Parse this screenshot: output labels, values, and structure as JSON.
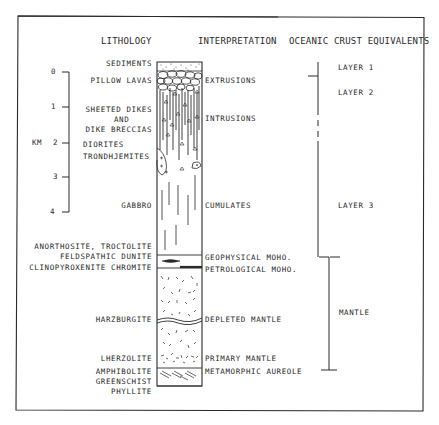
{
  "headers": {
    "lithology": "LITHOLOGY",
    "interpretation": "INTERPRETATION",
    "oceanic": "OCEANIC CRUST EQUIVALENTS"
  },
  "scale": {
    "unit": "KM",
    "ticks": [
      "0",
      "1",
      "2",
      "3",
      "4"
    ]
  },
  "lithology": [
    "SEDIMENTS",
    "PILLOW LAVAS",
    "SHEETED DIKES",
    "AND",
    "DIKE BRECCIAS",
    "DIORITES",
    "TRONDHJEMITES",
    "GABBRO",
    "ANORTHOSITE, TROCTOLITE",
    "FELDSPATHIC  DUNITE",
    "CLINOPYROXENITE  CHROMITE",
    "HARZBURGITE",
    "LHERZOLITE",
    "AMPHIBOLITE",
    "GREENSCHIST",
    "PHYLLITE"
  ],
  "interpretation": [
    "EXTRUSIONS",
    "INTRUSIONS",
    "CUMULATES",
    "GEOPHYSICAL MOHO.",
    "PETROLOGICAL MOHO.",
    "DEPLETED MANTLE",
    "PRIMARY MANTLE",
    "METAMORPHIC AUREOLE"
  ],
  "oceanic": [
    "LAYER 1",
    "LAYER 2",
    "LAYER 3",
    "MANTLE"
  ],
  "colors": {
    "ink": "#2a2a2a",
    "background": "#ffffff"
  }
}
